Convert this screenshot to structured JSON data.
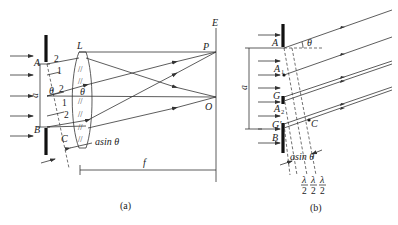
{
  "figure_a": {
    "caption": "(a)",
    "labels": {
      "A": "A",
      "B": "B",
      "C": "C",
      "L": "L",
      "E": "E",
      "P": "P",
      "O": "O",
      "a": "a",
      "f": "f",
      "theta_left": "θ",
      "theta_lens": "θ",
      "asin_theta": "asin θ"
    },
    "zone_numbers": [
      "2",
      "1",
      "2",
      "1",
      "2"
    ]
  },
  "figure_b": {
    "caption": "(b)",
    "labels": {
      "A": "A",
      "A1": "A",
      "A1_sub": "1",
      "G": "G",
      "A2": "A",
      "A2_sub": "2",
      "G_prime": "G′",
      "B": "B",
      "C": "C",
      "a": "a",
      "theta": "θ",
      "asin_theta": "asin θ",
      "lambda": "λ",
      "two": "2"
    }
  }
}
